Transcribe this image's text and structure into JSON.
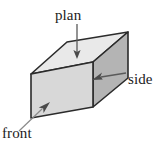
{
  "figure": {
    "background_color": "#ffffff",
    "labels": {
      "plan": "plan",
      "side": "side",
      "front": "front"
    },
    "solid": {
      "name": "cuboid",
      "faces": [
        {
          "name": "top-face",
          "label_ref": "plan",
          "fill": "#e9e9e9"
        },
        {
          "name": "front-face",
          "label_ref": "front",
          "fill": "#d8d8d8"
        },
        {
          "name": "side-face",
          "label_ref": "side",
          "fill": "#b4b4b4"
        }
      ],
      "outline_color": "#2b2b2b",
      "outline_width": 1.6
    },
    "leaders": [
      {
        "name": "plan-arrow",
        "from": [
          77,
          24
        ],
        "to": [
          77,
          58
        ],
        "direction": "down",
        "color": "#5a5a5a"
      },
      {
        "name": "side-arrow",
        "from": [
          126,
          73
        ],
        "to": [
          93,
          80
        ],
        "direction": "left",
        "color": "#5a5a5a"
      },
      {
        "name": "front-arrow",
        "from": [
          20,
          130
        ],
        "to": [
          49,
          103
        ],
        "direction": "up-right",
        "color": "#7a7a7a"
      }
    ]
  }
}
